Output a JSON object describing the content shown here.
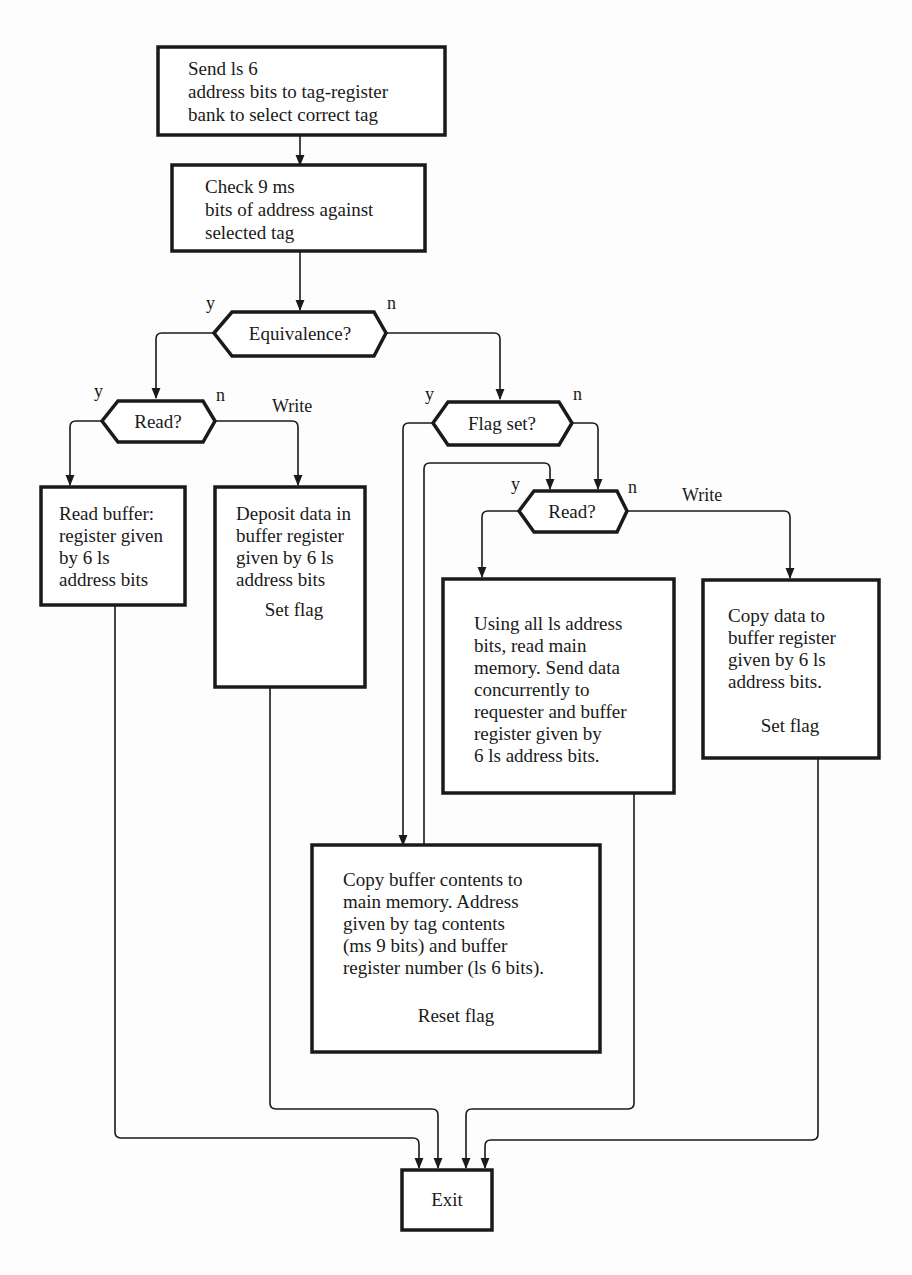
{
  "flowchart": {
    "start": {
      "lines": [
        "Send ls 6",
        "address bits to tag-register",
        "bank to select correct tag"
      ]
    },
    "check_tag": {
      "lines": [
        "Check 9 ms",
        "bits of address against",
        "selected tag"
      ]
    },
    "equivalence": {
      "label": "Equivalence?",
      "yes": "y",
      "no": "n"
    },
    "read_hit": {
      "label": "Read?",
      "yes": "y",
      "no": "n",
      "no_branch": "Write"
    },
    "read_buffer": {
      "lines": [
        "Read buffer:",
        "register given",
        "by 6 ls",
        "address bits"
      ]
    },
    "deposit": {
      "lines": [
        "Deposit data in",
        "buffer register",
        "given by 6 ls",
        "address bits"
      ],
      "action": "Set flag"
    },
    "flag_set": {
      "label": "Flag set?",
      "yes": "y",
      "no": "n"
    },
    "read_miss": {
      "label": "Read?",
      "yes": "y",
      "no": "n",
      "no_branch": "Write"
    },
    "read_main": {
      "lines": [
        "Using all ls address",
        "bits, read main",
        "memory. Send data",
        "concurrently to",
        "requester and buffer",
        "register given by",
        "6 ls address bits."
      ]
    },
    "copy_data": {
      "lines": [
        "Copy data to",
        "buffer register",
        "given by 6 ls",
        "address bits."
      ],
      "action": "Set flag"
    },
    "copy_back": {
      "lines": [
        "Copy buffer contents to",
        "main memory. Address",
        "given by tag contents",
        "(ms 9 bits) and buffer",
        "register number (ls 6 bits)."
      ],
      "action": "Reset flag"
    },
    "exit": {
      "label": "Exit"
    }
  },
  "colors": {
    "ink": "#1a1a1a",
    "paper": "#fdfdfd"
  }
}
